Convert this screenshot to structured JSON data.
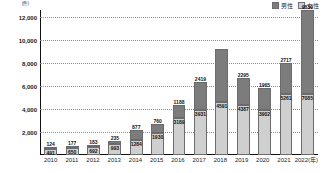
{
  "legend": {
    "position": "top-right",
    "entries": [
      {
        "label": "男性",
        "color": "#7c7c7c",
        "key": "male"
      },
      {
        "label": "女性",
        "color": "#cfcfcf",
        "key": "female"
      }
    ]
  },
  "axis": {
    "y_unit": "(件)",
    "y_ticks": [
      12000,
      10000,
      8000,
      6000,
      4000,
      2000
    ],
    "y_tick_labels": [
      "12,000",
      "10,000",
      "8,000",
      "6,000",
      "4,000",
      "2,000"
    ],
    "ymin": 0,
    "ymax": 12600,
    "grid": true
  },
  "chart_data": {
    "type": "bar",
    "title": "",
    "subtitle": "",
    "xlabel": "",
    "ylabel": "(件)",
    "ylim": [
      0,
      12600
    ],
    "grid": true,
    "legend_position": "top-right",
    "stacked": true,
    "categories": [
      "2010",
      "2011",
      "2012",
      "2013",
      "2014",
      "2015",
      "2016",
      "2017",
      "2018",
      "2019",
      "2020",
      "2021",
      "2022(年)"
    ],
    "series": [
      {
        "name": "男性",
        "color": "#7c7c7c",
        "values": [
          124,
          177,
          183,
          235,
          877,
          760,
          1188,
          2419,
          4591,
          2295,
          1965,
          2717,
          9839
        ]
      },
      {
        "name": "女性",
        "color": "#cfcfcf",
        "values": [
          491,
          650,
          692,
          993,
          1284,
          1930,
          3189,
          3931,
          4591,
          4387,
          3902,
          5261,
          7085
        ]
      }
    ],
    "annotations": [
      {
        "category": "2010",
        "series": "男性",
        "text": "124"
      },
      {
        "category": "2010",
        "series": "女性",
        "text": "491"
      },
      {
        "category": "2011",
        "series": "男性",
        "text": "177"
      },
      {
        "category": "2011",
        "series": "女性",
        "text": "650"
      },
      {
        "category": "2012",
        "series": "男性",
        "text": "183"
      },
      {
        "category": "2012",
        "series": "女性",
        "text": "692"
      },
      {
        "category": "2013",
        "series": "男性",
        "text": "235"
      },
      {
        "category": "2013",
        "series": "女性",
        "text": "993"
      },
      {
        "category": "2014",
        "series": "男性",
        "text": "877"
      },
      {
        "category": "2014",
        "series": "女性",
        "text": "1284"
      },
      {
        "category": "2015",
        "series": "男性",
        "text": "760"
      },
      {
        "category": "2015",
        "series": "女性",
        "text": "1930"
      },
      {
        "category": "2016",
        "series": "男性",
        "text": "1188"
      },
      {
        "category": "2016",
        "series": "女性",
        "text": "3189"
      },
      {
        "category": "2017",
        "series": "男性",
        "text": "2419"
      },
      {
        "category": "2017",
        "series": "女性",
        "text": "3931"
      },
      {
        "category": "2018",
        "series": "女性",
        "text": "4591"
      },
      {
        "category": "2019",
        "series": "男性",
        "text": "2295"
      },
      {
        "category": "2019",
        "series": "女性",
        "text": "4387"
      },
      {
        "category": "2020",
        "series": "男性",
        "text": "1965"
      },
      {
        "category": "2020",
        "series": "女性",
        "text": "3902"
      },
      {
        "category": "2021",
        "series": "男性",
        "text": "2717"
      },
      {
        "category": "2021",
        "series": "女性",
        "text": "5261"
      },
      {
        "category": "2022(年)",
        "series": "男性",
        "text": "9839"
      },
      {
        "category": "2022(年)",
        "series": "女性",
        "text": "7085"
      }
    ]
  }
}
